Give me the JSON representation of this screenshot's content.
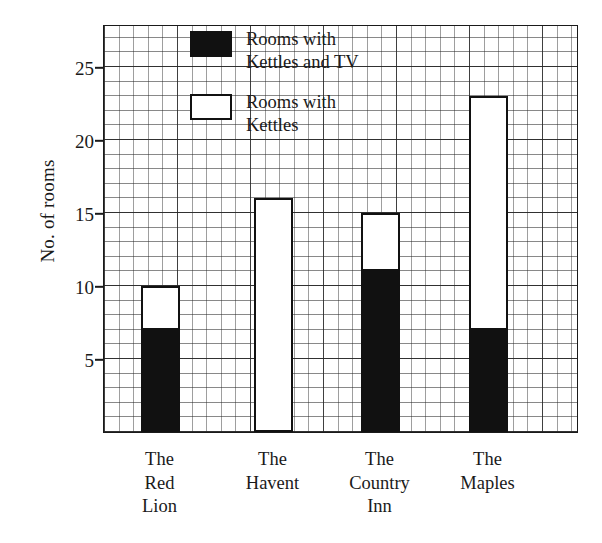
{
  "chart_data": {
    "type": "bar",
    "subtype": "stacked",
    "title": "",
    "xlabel": "",
    "ylabel": "No. of rooms",
    "ylim": [
      0,
      28
    ],
    "ytick_values": [
      5,
      10,
      15,
      20,
      25
    ],
    "ytick_labels": [
      "5",
      "10",
      "15",
      "20",
      "25"
    ],
    "grid": "minor and major squared graph paper grid",
    "legend_position": "top-center-inside",
    "categories": [
      "The\nRed\nLion",
      "The\nHavent",
      "The\nCountry\nInn",
      "The\nMaples"
    ],
    "series": [
      {
        "name": "Rooms with\nKettles and TV",
        "fill": "black",
        "values": [
          7,
          0,
          11,
          7
        ]
      },
      {
        "name": "Rooms with\nKettles",
        "fill": "white",
        "values": [
          3,
          16,
          4,
          16
        ]
      }
    ],
    "totals": [
      10,
      16,
      15,
      23
    ],
    "colors": {
      "dark": "#111111",
      "light": "#ffffff",
      "axis": "#1a1a1a",
      "grid_major": "#303030",
      "grid_minor": "#606060"
    }
  },
  "legend": {
    "items": [
      {
        "label": "Rooms with\nKettles and TV",
        "swatch": "dark-square-icon"
      },
      {
        "label": "Rooms with\nKettles",
        "swatch": "light-square-icon"
      }
    ]
  },
  "axis": {
    "y_title": "No. of rooms",
    "y_ticks": [
      "25",
      "20",
      "15",
      "10",
      "5"
    ],
    "x_categories": [
      "The\nRed\nLion",
      "The\nHavent",
      "The\nCountry\nInn",
      "The\nMaples"
    ]
  }
}
